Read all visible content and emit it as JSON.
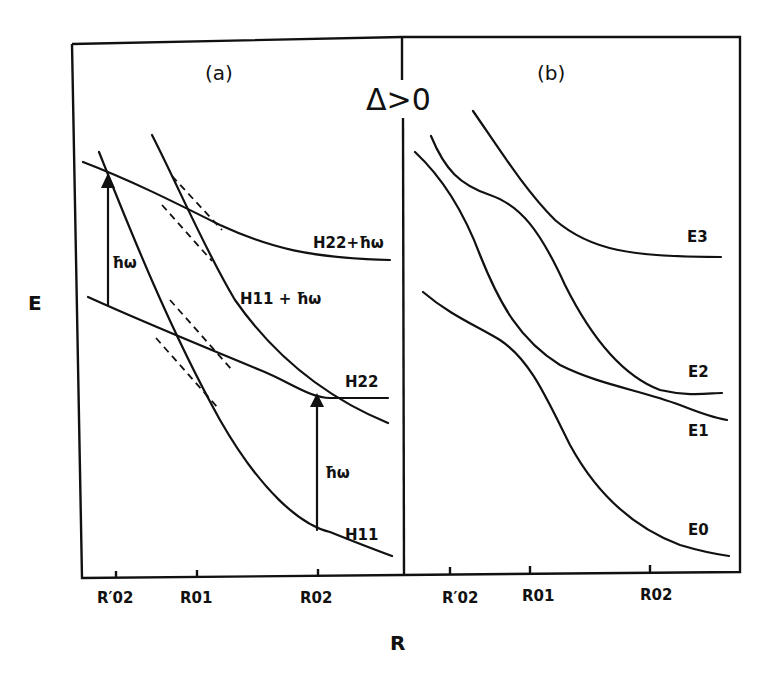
{
  "figure": {
    "condition_label": "Δ>0",
    "y_axis_label": "E",
    "x_axis_label": "R",
    "panels": [
      {
        "id": "a",
        "label": "(a)",
        "ticks": [
          "R′02",
          "R01",
          "R02"
        ],
        "curve_labels": {
          "h22_plus": "H22+ħω",
          "h11_plus": "H11 + ħω",
          "h22": "H22",
          "h11": "H11"
        },
        "arrow_labels": [
          "ħω",
          "ħω"
        ]
      },
      {
        "id": "b",
        "label": "(b)",
        "ticks": [
          "R′02",
          "R01",
          "R02"
        ],
        "curve_labels": [
          "E3",
          "E2",
          "E1",
          "E0"
        ]
      }
    ],
    "colors": {
      "ink": "#111111",
      "background": "#ffffff"
    }
  }
}
